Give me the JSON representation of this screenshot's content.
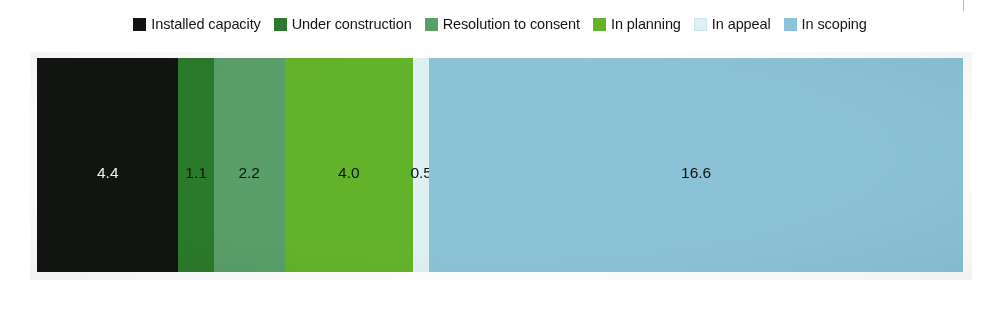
{
  "legend": {
    "items": [
      {
        "label": "Installed capacity",
        "color": "#111410",
        "swatch_name": "legend-swatch-installed-capacity"
      },
      {
        "label": "Under construction",
        "color": "#2b7a2b",
        "swatch_name": "legend-swatch-under-construction"
      },
      {
        "label": "Resolution to consent",
        "color": "#5a9e69",
        "swatch_name": "legend-swatch-resolution-to-consent"
      },
      {
        "label": "In planning",
        "color": "#63b32a",
        "swatch_name": "legend-swatch-in-planning"
      },
      {
        "label": "In appeal",
        "color": "#dff0f2",
        "swatch_name": "legend-swatch-in-appeal"
      },
      {
        "label": "In scoping",
        "color": "#8cc2d8",
        "swatch_name": "legend-swatch-in-scoping"
      }
    ]
  },
  "chart_data": {
    "type": "bar",
    "orientation": "horizontal",
    "stacked": true,
    "title": "",
    "xlabel": "",
    "ylabel": "",
    "grid": false,
    "legend_position": "top",
    "categories": [
      ""
    ],
    "series": [
      {
        "name": "Installed capacity",
        "values": [
          4.4
        ],
        "label": "4.4",
        "color": "#111410",
        "label_color": "#f2f2f2"
      },
      {
        "name": "Under construction",
        "values": [
          1.1
        ],
        "label": "1.1",
        "color": "#2b7a2b",
        "label_color": "#101510"
      },
      {
        "name": "Resolution to consent",
        "values": [
          2.2
        ],
        "label": "2.2",
        "color": "#5a9e69",
        "label_color": "#101510"
      },
      {
        "name": "In planning",
        "values": [
          4.0
        ],
        "label": "4.0",
        "color": "#63b32a",
        "label_color": "#101510"
      },
      {
        "name": "In appeal",
        "values": [
          0.5
        ],
        "label": "0.5",
        "color": "#dff0f2",
        "label_color": "#101510"
      },
      {
        "name": "In scoping",
        "values": [
          16.6
        ],
        "label": "16.6",
        "color": "#8cc2d8",
        "label_color": "#101510"
      }
    ],
    "total": 28.8,
    "xlim": [
      0,
      28.8
    ],
    "units": "GW"
  }
}
